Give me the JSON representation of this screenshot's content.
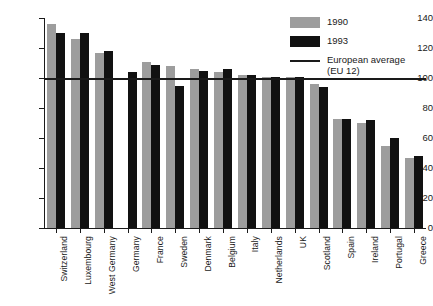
{
  "chart_data": {
    "type": "bar",
    "title": "",
    "xlabel": "",
    "ylabel": "",
    "ylim": [
      0,
      140
    ],
    "yticks": [
      0,
      20,
      40,
      60,
      80,
      100,
      120,
      140
    ],
    "grid": false,
    "legend_position": "top-right",
    "categories": [
      "Switzerland",
      "Luxembourg",
      "West Germany",
      "Germany",
      "France",
      "Sweden",
      "Denmark",
      "Belgium",
      "Italy",
      "Netherlands",
      "UK",
      "Scotland",
      "Spain",
      "Ireland",
      "Portugal",
      "Greece"
    ],
    "series": [
      {
        "name": "1990",
        "color": "#9d9d9d",
        "values": [
          136,
          126,
          117,
          null,
          111,
          108,
          106,
          104,
          102,
          101,
          101,
          96,
          73,
          70,
          55,
          47
        ]
      },
      {
        "name": "1993",
        "color": "#111111",
        "values": [
          130,
          130,
          118,
          104,
          109,
          95,
          105,
          106,
          102,
          101,
          101,
          94,
          73,
          72,
          60,
          48
        ]
      }
    ],
    "reference_line": {
      "label": "European average",
      "sublabel": "(EU 12)",
      "value": 100,
      "color": "#1a1a1a"
    }
  },
  "legend": {
    "items": [
      {
        "label": "1990",
        "sublabel": "",
        "swatch": "gray-square"
      },
      {
        "label": "1993",
        "sublabel": "",
        "swatch": "black-square"
      },
      {
        "label": "European average",
        "sublabel": "(EU 12)",
        "swatch": "line"
      }
    ]
  },
  "axis": {
    "y_tick_labels": [
      "140",
      "120",
      "100",
      "80",
      "60",
      "40",
      "20",
      "0"
    ]
  }
}
